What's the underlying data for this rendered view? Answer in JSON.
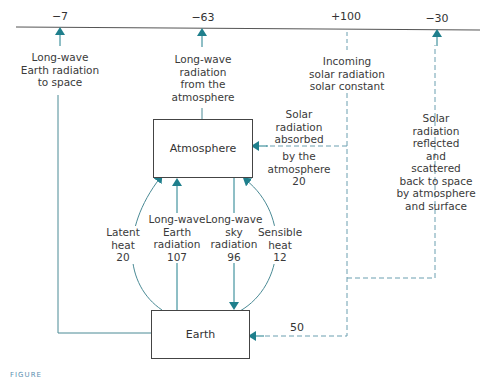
{
  "colors": {
    "arrow": "#1f7f8c",
    "line": "#4a8a95",
    "dashed": "#6a9fb0",
    "box_border": "#444444"
  },
  "top_values": {
    "longwave_earth_space": "−7",
    "longwave_atmosphere": "−63",
    "incoming_solar": "+100",
    "reflected": "−30"
  },
  "boxes": {
    "atmosphere": "Atmosphere",
    "earth": "Earth"
  },
  "labels": {
    "longwave_earth_space": [
      "Long-wave",
      "Earth radiation",
      "to space"
    ],
    "longwave_atmosphere": [
      "Long-wave",
      "radiation",
      "from the",
      "atmosphere"
    ],
    "incoming_solar": [
      "Incoming",
      "solar radiation",
      "solar constant"
    ],
    "solar_absorbed_top": [
      "Solar",
      "radiation",
      "absorbed"
    ],
    "solar_absorbed_bottom": [
      "by the",
      "atmosphere",
      "20"
    ],
    "reflected": [
      "Solar",
      "radiation",
      "reflected",
      "and",
      "scattered",
      "back to space",
      "by atmosphere",
      "and surface"
    ],
    "latent_heat": [
      "Latent",
      "heat",
      "20"
    ],
    "longwave_earth_radiation": [
      "Long-wave",
      "Earth",
      "radiation",
      "107"
    ],
    "longwave_sky_radiation": [
      "Long-wave",
      "sky",
      "radiation",
      "96"
    ],
    "sensible_heat": [
      "Sensible",
      "heat",
      "12"
    ],
    "surface_solar": "50"
  },
  "figure_caption": "FIGURE"
}
